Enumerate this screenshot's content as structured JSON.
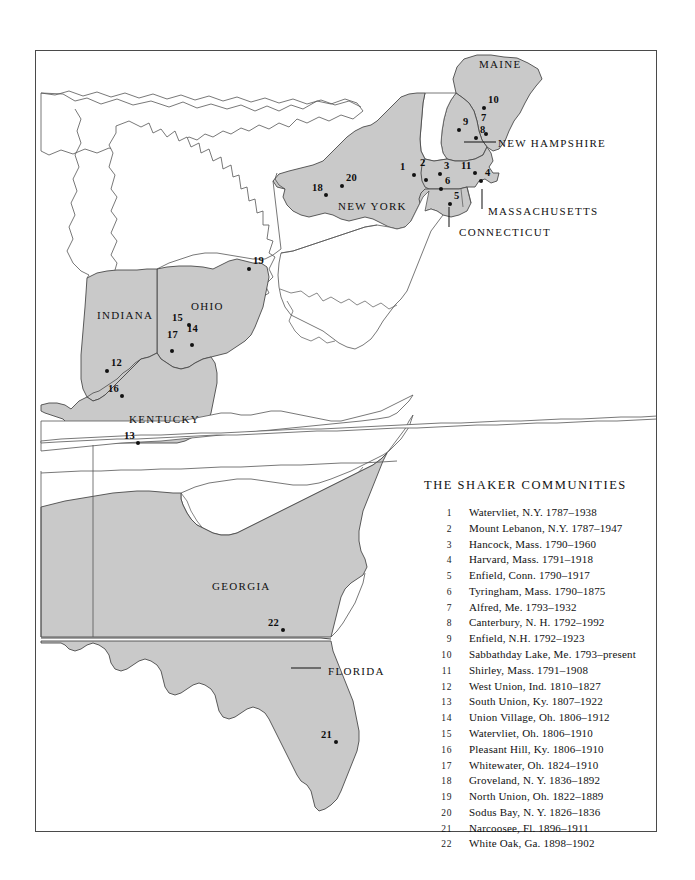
{
  "map": {
    "frame": {
      "x": 35,
      "y": 50,
      "width": 622,
      "height": 782
    },
    "fill_color": "#c9c9c9",
    "stroke_color": "#4a4a4a",
    "state_labels": [
      {
        "name": "maine",
        "text": "MAINE",
        "x": 478,
        "y": 57
      },
      {
        "name": "new-hampshire",
        "text": "NEW HAMPSHIRE",
        "x": 497,
        "y": 136
      },
      {
        "name": "massachusetts",
        "text": "MASSACHUSETTS",
        "x": 487,
        "y": 204
      },
      {
        "name": "connecticut",
        "text": "CONNECTICUT",
        "x": 458,
        "y": 225
      },
      {
        "name": "new-york",
        "text": "NEW YORK",
        "x": 337,
        "y": 199
      },
      {
        "name": "ohio",
        "text": "OHIO",
        "x": 190,
        "y": 299
      },
      {
        "name": "indiana",
        "text": "INDIANA",
        "x": 96,
        "y": 308
      },
      {
        "name": "kentucky",
        "text": "KENTUCKY",
        "x": 128,
        "y": 412
      },
      {
        "name": "georgia",
        "text": "GEORGIA",
        "x": 211,
        "y": 579
      },
      {
        "name": "florida",
        "text": "FLORIDA",
        "x": 327,
        "y": 664
      }
    ],
    "markers": [
      {
        "id": 1,
        "label": "1",
        "lx": 399,
        "ly": 167,
        "dx": 411,
        "dy": 172
      },
      {
        "id": 2,
        "label": "2",
        "lx": 419,
        "ly": 163,
        "dx": 423,
        "dy": 177
      },
      {
        "id": 3,
        "label": "3",
        "lx": 443,
        "ly": 166,
        "dx": 437,
        "dy": 171
      },
      {
        "id": 4,
        "label": "4",
        "lx": 484,
        "ly": 173,
        "dx": 478,
        "dy": 178
      },
      {
        "id": 5,
        "label": "5",
        "lx": 453,
        "ly": 196,
        "dx": 447,
        "dy": 201
      },
      {
        "id": 6,
        "label": "6",
        "lx": 444,
        "ly": 181,
        "dx": 438,
        "dy": 186
      },
      {
        "id": 7,
        "label": "7",
        "lx": 480,
        "ly": 118,
        "dx": 483,
        "dy": 131
      },
      {
        "id": 8,
        "label": "8",
        "lx": 479,
        "ly": 130,
        "dx": 473,
        "dy": 135
      },
      {
        "id": 9,
        "label": "9",
        "lx": 462,
        "ly": 122,
        "dx": 456,
        "dy": 127
      },
      {
        "id": 10,
        "label": "10",
        "lx": 487,
        "ly": 100,
        "dx": 481,
        "dy": 105
      },
      {
        "id": 11,
        "label": "11",
        "lx": 460,
        "ly": 166,
        "dx": 472,
        "dy": 170
      },
      {
        "id": 12,
        "label": "12",
        "lx": 110,
        "ly": 363,
        "dx": 104,
        "dy": 368
      },
      {
        "id": 13,
        "label": "13",
        "lx": 123,
        "ly": 436,
        "dx": 135,
        "dy": 440
      },
      {
        "id": 14,
        "label": "14",
        "lx": 186,
        "ly": 329,
        "dx": 189,
        "dy": 342
      },
      {
        "id": 15,
        "label": "15",
        "lx": 171,
        "ly": 318,
        "dx": 186,
        "dy": 322
      },
      {
        "id": 16,
        "label": "16",
        "lx": 107,
        "ly": 389,
        "dx": 119,
        "dy": 393
      },
      {
        "id": 17,
        "label": "17",
        "lx": 166,
        "ly": 335,
        "dx": 169,
        "dy": 348
      },
      {
        "id": 18,
        "label": "18",
        "lx": 311,
        "ly": 188,
        "dx": 323,
        "dy": 192
      },
      {
        "id": 19,
        "label": "19",
        "lx": 252,
        "ly": 261,
        "dx": 246,
        "dy": 266
      },
      {
        "id": 20,
        "label": "20",
        "lx": 345,
        "ly": 178,
        "dx": 339,
        "dy": 183
      },
      {
        "id": 21,
        "label": "21",
        "lx": 320,
        "ly": 735,
        "dx": 333,
        "dy": 739
      },
      {
        "id": 22,
        "label": "22",
        "lx": 267,
        "ly": 623,
        "dx": 280,
        "dy": 627
      }
    ]
  },
  "legend": {
    "title": "THE SHAKER COMMUNITIES",
    "entries": [
      {
        "num": "1",
        "text": "Watervliet, N.Y. 1787–1938"
      },
      {
        "num": "2",
        "text": "Mount Lebanon, N.Y. 1787–1947"
      },
      {
        "num": "3",
        "text": "Hancock, Mass. 1790–1960"
      },
      {
        "num": "4",
        "text": "Harvard, Mass. 1791–1918"
      },
      {
        "num": "5",
        "text": "Enfield, Conn. 1790–1917"
      },
      {
        "num": "6",
        "text": "Tyringham, Mass. 1790–1875"
      },
      {
        "num": "7",
        "text": "Alfred, Me. 1793–1932"
      },
      {
        "num": "8",
        "text": "Canterbury, N. H. 1792–1992"
      },
      {
        "num": "9",
        "text": "Enfield, N.H. 1792–1923"
      },
      {
        "num": "10",
        "text": "Sabbathday Lake, Me. 1793–present"
      },
      {
        "num": "11",
        "text": "Shirley, Mass. 1791–1908"
      },
      {
        "num": "12",
        "text": "West Union, Ind. 1810–1827"
      },
      {
        "num": "13",
        "text": "South Union, Ky. 1807–1922"
      },
      {
        "num": "14",
        "text": "Union Village, Oh. 1806–1912"
      },
      {
        "num": "15",
        "text": "Watervliet, Oh. 1806–1910"
      },
      {
        "num": "16",
        "text": "Pleasant Hill, Ky. 1806–1910"
      },
      {
        "num": "17",
        "text": "Whitewater, Oh. 1824–1910"
      },
      {
        "num": "18",
        "text": "Groveland, N. Y. 1836–1892"
      },
      {
        "num": "19",
        "text": "North Union, Oh. 1822–1889"
      },
      {
        "num": "20",
        "text": "Sodus Bay, N. Y. 1826–1836"
      },
      {
        "num": "21",
        "text": "Narcoosee, Fl. 1896–1911"
      },
      {
        "num": "22",
        "text": "White Oak, Ga. 1898–1902"
      }
    ]
  }
}
